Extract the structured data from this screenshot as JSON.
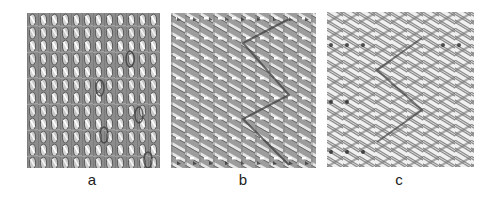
{
  "figure": {
    "panels": [
      {
        "id": "a",
        "label": "a",
        "description": "knitted fabric structure, interlocking vertical loops",
        "pattern": "loops"
      },
      {
        "id": "b",
        "label": "b",
        "description": "knitted fabric structure, chevron zigzag with dense diagonal yarns",
        "pattern": "chevron-dense"
      },
      {
        "id": "c",
        "label": "c",
        "description": "knitted fabric structure, chevron zigzag with open diagonal yarns",
        "pattern": "chevron-open"
      }
    ],
    "colors": {
      "background": "#ffffff",
      "yarn_light": "#e8e8e8",
      "yarn_mid": "#a0a0a0",
      "yarn_dark": "#4a4a4a",
      "label": "#222222"
    }
  }
}
